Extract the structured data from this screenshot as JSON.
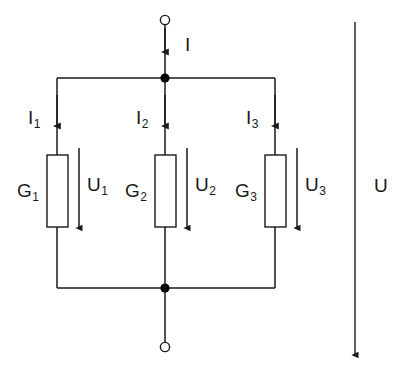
{
  "diagram": {
    "type": "electrical-schematic",
    "colors": {
      "wire": "#1a1a1a",
      "label": "#1a1a1a",
      "background": "#ffffff",
      "node": "#000000"
    },
    "total_current_label": {
      "symbol": "I",
      "subscript": ""
    },
    "total_voltage_label": {
      "symbol": "U",
      "subscript": ""
    },
    "branches": [
      {
        "current_symbol": "I",
        "current_subscript": "1",
        "element_symbol": "G",
        "element_subscript": "1",
        "voltage_symbol": "U",
        "voltage_subscript": "1"
      },
      {
        "current_symbol": "I",
        "current_subscript": "2",
        "element_symbol": "G",
        "element_subscript": "2",
        "voltage_symbol": "U",
        "voltage_subscript": "2"
      },
      {
        "current_symbol": "I",
        "current_subscript": "3",
        "element_symbol": "G",
        "element_subscript": "3",
        "voltage_symbol": "U",
        "voltage_subscript": "3"
      }
    ],
    "terminals": [
      {
        "name": "top-terminal"
      },
      {
        "name": "bottom-terminal"
      }
    ]
  }
}
